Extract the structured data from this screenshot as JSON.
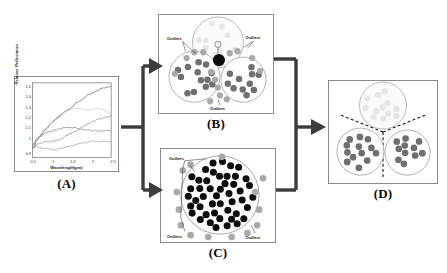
{
  "figure": {
    "caption_panels": [
      "(A)",
      "(B)",
      "(C)",
      "(D)"
    ],
    "flow": "A splits into B and C; B and C merge into D"
  },
  "panels": {
    "a": {
      "letter": "(A)",
      "name": "spectra-plot"
    },
    "b": {
      "letter": "(B)",
      "name": "three-cluster-outlier-diagram",
      "labels": [
        "Outliers",
        "Outliers",
        "Outliers"
      ]
    },
    "c": {
      "letter": "(C)",
      "name": "single-cluster-outlier-diagram",
      "labels": [
        "Outliers",
        "Outliers",
        "Outliers"
      ]
    },
    "d": {
      "letter": "(D)",
      "name": "partitioned-clusters-diagram"
    }
  },
  "chart_data": {
    "type": "line",
    "title": "",
    "xlabel": "Wavelength(µm)",
    "ylabel": "Relative Reflectance",
    "xlim": [
      0.5,
      2.5
    ],
    "ylim": [
      0.85,
      1.55
    ],
    "xticks": [
      "0.5",
      "1",
      "1.5",
      "2",
      "2.5"
    ],
    "xtick_values": [
      0.5,
      1,
      1.5,
      2,
      2.5
    ],
    "yticks": [
      "0.9",
      "1",
      "1.1",
      "1.2",
      "1.3",
      "1.4",
      "1.5"
    ],
    "ytick_values": [
      0.9,
      1.0,
      1.1,
      1.2,
      1.3,
      1.4,
      1.5
    ],
    "grid": false,
    "legend": "none",
    "series": [
      {
        "name": "spectrum-1",
        "color": "#4a4a4a",
        "x": [
          0.5,
          0.6,
          0.7,
          0.8,
          0.9,
          1.0,
          1.1,
          1.2,
          1.3,
          1.4,
          1.5,
          1.6,
          1.7,
          1.8,
          1.9,
          2.0,
          2.1,
          2.2,
          2.3,
          2.4,
          2.5
        ],
        "y": [
          0.93,
          1.0,
          1.05,
          1.1,
          1.14,
          1.18,
          1.21,
          1.24,
          1.27,
          1.3,
          1.32,
          1.36,
          1.38,
          1.4,
          1.44,
          1.45,
          1.47,
          1.49,
          1.5,
          1.51,
          1.52
        ]
      },
      {
        "name": "spectrum-2",
        "color": "#bdbdbd",
        "x": [
          0.5,
          0.6,
          0.7,
          0.8,
          0.9,
          1.0,
          1.1,
          1.2,
          1.3,
          1.4,
          1.5,
          1.6,
          1.7,
          1.8,
          1.9,
          2.0,
          2.1,
          2.2,
          2.3,
          2.4,
          2.5
        ],
        "y": [
          0.95,
          1.03,
          1.07,
          1.11,
          1.15,
          1.19,
          1.22,
          1.25,
          1.27,
          1.29,
          1.3,
          1.31,
          1.31,
          1.3,
          1.29,
          1.3,
          1.31,
          1.31,
          1.3,
          1.28,
          1.26
        ]
      },
      {
        "name": "spectrum-3",
        "color": "#6e6e6e",
        "x": [
          0.5,
          0.6,
          0.7,
          0.8,
          0.9,
          1.0,
          1.1,
          1.2,
          1.3,
          1.4,
          1.5,
          1.6,
          1.7,
          1.8,
          1.9,
          2.0,
          2.1,
          2.2,
          2.3,
          2.4,
          2.5
        ],
        "y": [
          0.96,
          1.02,
          1.05,
          1.07,
          1.09,
          1.1,
          1.11,
          1.12,
          1.13,
          1.13,
          1.13,
          1.13,
          1.12,
          1.11,
          1.11,
          1.1,
          1.1,
          1.1,
          1.1,
          1.1,
          1.1
        ]
      },
      {
        "name": "spectrum-4",
        "color": "#7a7a7a",
        "x": [
          0.5,
          0.6,
          0.7,
          0.8,
          0.9,
          1.0,
          1.1,
          1.2,
          1.3,
          1.4,
          1.5,
          1.6,
          1.7,
          1.8,
          1.9,
          2.0,
          2.1,
          2.2,
          2.3,
          2.4,
          2.5
        ],
        "y": [
          0.93,
          0.97,
          0.98,
          0.99,
          1.0,
          1.0,
          1.01,
          1.02,
          1.04,
          1.06,
          1.08,
          1.1,
          1.12,
          1.14,
          1.16,
          1.18,
          1.2,
          1.21,
          1.22,
          1.23,
          1.24
        ]
      },
      {
        "name": "spectrum-5",
        "color": "#8a8a8a",
        "x": [
          0.5,
          0.6,
          0.7,
          0.8,
          0.9,
          1.0,
          1.1,
          1.2,
          1.3,
          1.4,
          1.5,
          1.6,
          1.7,
          1.8,
          1.9,
          2.0,
          2.1,
          2.2,
          2.3,
          2.4,
          2.5
        ],
        "y": [
          0.94,
          0.95,
          0.94,
          0.93,
          0.93,
          0.92,
          0.92,
          0.93,
          0.94,
          0.95,
          0.96,
          0.97,
          0.98,
          0.99,
          0.99,
          1.0,
          1.0,
          1.0,
          1.0,
          1.0,
          1.0
        ]
      }
    ]
  },
  "colors": {
    "dot_gray": "#6f6f6f",
    "dot_black": "#0d0d0d",
    "outlier_gray": "#a9a9a9",
    "panel_border": "#8a8a8a",
    "arrow": "#3c3c3c",
    "faint": "#e6e6e6"
  }
}
